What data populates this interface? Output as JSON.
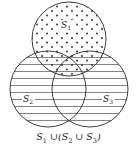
{
  "diagram": {
    "type": "venn",
    "sets": [
      {
        "id": "S1",
        "label": "S",
        "subscript": "1",
        "fill": "dots"
      },
      {
        "id": "S2",
        "label": "S",
        "subscript": "2",
        "fill": "horizontal-lines"
      },
      {
        "id": "S3",
        "label": "S",
        "subscript": "3",
        "fill": "horizontal-lines"
      }
    ],
    "caption": {
      "s1": "S",
      "s1_sub": "1",
      "op1": " ∪(",
      "s2": "S",
      "s2_sub": "2",
      "op2": " ∪ ",
      "s3": "S",
      "s3_sub": "3",
      "close": ")"
    },
    "colors": {
      "stroke": "#2a2a2a",
      "hatch": "#555555",
      "dot": "#222222",
      "background": "#ffffff"
    }
  }
}
